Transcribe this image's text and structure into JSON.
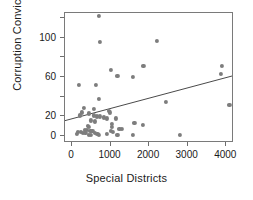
{
  "chart_data": {
    "type": "scatter",
    "title": "",
    "xlabel": "Special Districts",
    "ylabel": "Corruption Convictions",
    "xlim": [
      -180,
      4200
    ],
    "ylim": [
      -7,
      125
    ],
    "xticks": [
      0,
      1000,
      2000,
      3000,
      4000
    ],
    "xticklabels": [
      "0",
      "1000",
      "2000",
      "3000",
      "4000"
    ],
    "yticks": [
      0,
      20,
      60,
      100
    ],
    "yticklabels": [
      "0",
      "20",
      "60",
      "100"
    ],
    "yminorticks": [
      40,
      80,
      120
    ],
    "grid": false,
    "legend": false,
    "point_color": "#7d7d7d",
    "line_color": "#4a4a4a",
    "frame_color": "#7a7a7a",
    "points": [
      {
        "x": 700,
        "y": 122
      },
      {
        "x": 720,
        "y": 96
      },
      {
        "x": 2200,
        "y": 97
      },
      {
        "x": 1850,
        "y": 71
      },
      {
        "x": 3880,
        "y": 71
      },
      {
        "x": 1000,
        "y": 67
      },
      {
        "x": 3870,
        "y": 63
      },
      {
        "x": 1180,
        "y": 61
      },
      {
        "x": 1570,
        "y": 60
      },
      {
        "x": 180,
        "y": 52
      },
      {
        "x": 620,
        "y": 52
      },
      {
        "x": 700,
        "y": 38
      },
      {
        "x": 2430,
        "y": 35
      },
      {
        "x": 4080,
        "y": 32
      },
      {
        "x": 320,
        "y": 29
      },
      {
        "x": 560,
        "y": 28
      },
      {
        "x": 960,
        "y": 26
      },
      {
        "x": 250,
        "y": 24
      },
      {
        "x": 430,
        "y": 23
      },
      {
        "x": 975,
        "y": 24
      },
      {
        "x": 200,
        "y": 21
      },
      {
        "x": 560,
        "y": 21
      },
      {
        "x": 640,
        "y": 20
      },
      {
        "x": 720,
        "y": 20
      },
      {
        "x": 830,
        "y": 19
      },
      {
        "x": 900,
        "y": 18
      },
      {
        "x": 1130,
        "y": 18
      },
      {
        "x": 500,
        "y": 16
      },
      {
        "x": 600,
        "y": 15
      },
      {
        "x": 1620,
        "y": 13
      },
      {
        "x": 1830,
        "y": 11
      },
      {
        "x": 1040,
        "y": 12
      },
      {
        "x": 1040,
        "y": 9
      },
      {
        "x": 420,
        "y": 10
      },
      {
        "x": 450,
        "y": 9
      },
      {
        "x": 1230,
        "y": 7
      },
      {
        "x": 1290,
        "y": 7
      },
      {
        "x": 330,
        "y": 6
      },
      {
        "x": 380,
        "y": 6
      },
      {
        "x": 480,
        "y": 5
      },
      {
        "x": 530,
        "y": 5
      },
      {
        "x": 1020,
        "y": 5
      },
      {
        "x": 1060,
        "y": 4
      },
      {
        "x": 150,
        "y": 4
      },
      {
        "x": 230,
        "y": 4
      },
      {
        "x": 280,
        "y": 3
      },
      {
        "x": 350,
        "y": 3
      },
      {
        "x": 600,
        "y": 3
      },
      {
        "x": 660,
        "y": 2
      },
      {
        "x": 900,
        "y": 2
      },
      {
        "x": 130,
        "y": 2
      },
      {
        "x": 430,
        "y": 1
      },
      {
        "x": 490,
        "y": 1
      },
      {
        "x": 700,
        "y": 1
      },
      {
        "x": 1180,
        "y": 1
      },
      {
        "x": 1590,
        "y": 1
      },
      {
        "x": 2800,
        "y": 1
      }
    ],
    "trendline": {
      "x1": -180,
      "y1": 14,
      "x2": 4200,
      "y2": 60
    }
  }
}
